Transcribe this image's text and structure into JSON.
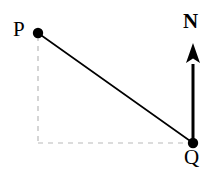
{
  "figure": {
    "background_color": "#ffffff",
    "width": 220,
    "height": 171
  },
  "labels": {
    "p": "P",
    "q": "Q",
    "n": "N"
  },
  "colors": {
    "stroke": "#000000",
    "point_fill": "#000000",
    "dashed_guide": "#b9b9b9"
  },
  "chart_data": {
    "type": "scatter",
    "xlabel": "",
    "ylabel": "",
    "grid": false,
    "legend": null,
    "points": [
      {
        "name": "P",
        "label": "P",
        "x": 38,
        "y": 33,
        "marker": "filled-circle",
        "radius": 5.2
      },
      {
        "name": "Q",
        "label": "Q",
        "x": 193,
        "y": 143,
        "marker": "filled-circle",
        "radius": 5.2
      }
    ],
    "segments": [
      {
        "name": "line-PQ",
        "style": "solid",
        "color": "#000000",
        "width": 1.6,
        "from": {
          "x": 38,
          "y": 33
        },
        "to": {
          "x": 193,
          "y": 143
        }
      },
      {
        "name": "guide-vertical-from-P",
        "style": "dashed",
        "color": "#b9b9b9",
        "width": 1.2,
        "from": {
          "x": 38,
          "y": 36
        },
        "to": {
          "x": 38,
          "y": 143
        }
      },
      {
        "name": "guide-horizontal-to-Q",
        "style": "dashed",
        "color": "#b9b9b9",
        "width": 1.2,
        "from": {
          "x": 38,
          "y": 143
        },
        "to": {
          "x": 190,
          "y": 143
        }
      }
    ],
    "arrow": {
      "name": "north-arrow",
      "label": "N",
      "color": "#000000",
      "shaft_width": 3,
      "tail": {
        "x": 193,
        "y": 143
      },
      "tip": {
        "x": 193,
        "y": 43
      },
      "head_half_width": 7,
      "head_length": 20
    },
    "label_positions": [
      {
        "text": "P",
        "x": 20,
        "y": 29,
        "anchor": "middle"
      },
      {
        "text": "Q",
        "x": 193,
        "y": 164,
        "anchor": "middle"
      },
      {
        "text": "N",
        "x": 193,
        "y": 28,
        "anchor": "middle"
      }
    ]
  }
}
